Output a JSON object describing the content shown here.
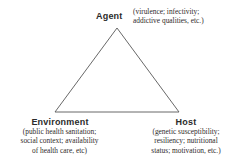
{
  "diagram": {
    "background_color": "#ffffff",
    "line_color": "#575757",
    "label_color": "#2b2b2b",
    "text_color": "#2f2b2b",
    "shape": {
      "type": "triangle",
      "apex": {
        "x": 117,
        "y": 28
      },
      "bottom_left": {
        "x": 55,
        "y": 112
      },
      "bottom_right": {
        "x": 179,
        "y": 112
      }
    },
    "vertices": [
      {
        "id": "agent",
        "label": "Agent",
        "detail_lines": [
          "(virulence; infectivity;",
          "addictive qualities, etc.)"
        ]
      },
      {
        "id": "environment",
        "label": "Environment",
        "detail_lines": [
          "(public health sanitation;",
          "social context; availability",
          "of health care, etc)"
        ]
      },
      {
        "id": "host",
        "label": "Host",
        "detail_lines": [
          "(genetic susceptibility;",
          "resiliency; nutritional",
          "status; motivation, etc.)"
        ]
      }
    ]
  }
}
